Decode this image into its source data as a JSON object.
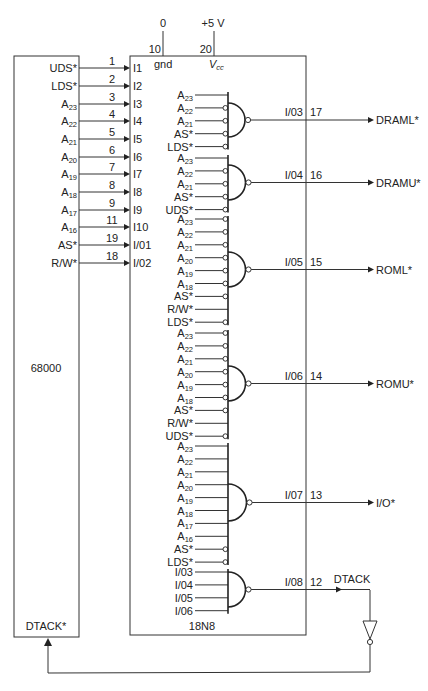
{
  "power": {
    "gnd_value": "0",
    "vcc_value": "+5 V",
    "gnd_pin": "10",
    "vcc_pin": "20",
    "gnd_label": "gnd",
    "vcc_label_main": "V",
    "vcc_label_sub": "cc"
  },
  "cpu": {
    "name": "68000",
    "dtack_label": "DTACK*",
    "signals": [
      {
        "base": "UDS*",
        "sub": "",
        "pin": "1",
        "pld_input": "I1"
      },
      {
        "base": "LDS*",
        "sub": "",
        "pin": "2",
        "pld_input": "I2"
      },
      {
        "base": "A",
        "sub": "23",
        "pin": "3",
        "pld_input": "I3"
      },
      {
        "base": "A",
        "sub": "22",
        "pin": "4",
        "pld_input": "I4"
      },
      {
        "base": "A",
        "sub": "21",
        "pin": "5",
        "pld_input": "I5"
      },
      {
        "base": "A",
        "sub": "20",
        "pin": "6",
        "pld_input": "I6"
      },
      {
        "base": "A",
        "sub": "19",
        "pin": "7",
        "pld_input": "I7"
      },
      {
        "base": "A",
        "sub": "18",
        "pin": "8",
        "pld_input": "I8"
      },
      {
        "base": "A",
        "sub": "17",
        "pin": "9",
        "pld_input": "I9"
      },
      {
        "base": "A",
        "sub": "16",
        "pin": "11",
        "pld_input": "I10"
      },
      {
        "base": "AS*",
        "sub": "",
        "pin": "19",
        "pld_input": "I/01"
      },
      {
        "base": "R/W*",
        "sub": "",
        "pin": "18",
        "pld_input": "I/02"
      }
    ]
  },
  "pld": {
    "name": "18N8",
    "gates": [
      {
        "output_pin_name": "I/03",
        "output_pin": "17",
        "signal": "DRAML*",
        "inputs": [
          {
            "base": "A",
            "sub": "23",
            "inverted": false
          },
          {
            "base": "A",
            "sub": "22",
            "inverted": true
          },
          {
            "base": "A",
            "sub": "21",
            "inverted": true
          },
          {
            "base": "AS*",
            "sub": "",
            "inverted": true
          },
          {
            "base": "LDS*",
            "sub": "",
            "inverted": true
          }
        ]
      },
      {
        "output_pin_name": "I/04",
        "output_pin": "16",
        "signal": "DRAMU*",
        "inputs": [
          {
            "base": "A",
            "sub": "23",
            "inverted": false
          },
          {
            "base": "A",
            "sub": "22",
            "inverted": true
          },
          {
            "base": "A",
            "sub": "21",
            "inverted": true
          },
          {
            "base": "AS*",
            "sub": "",
            "inverted": true
          },
          {
            "base": "UDS*",
            "sub": "",
            "inverted": true
          }
        ]
      },
      {
        "output_pin_name": "I/05",
        "output_pin": "15",
        "signal": "ROML*",
        "inputs": [
          {
            "base": "A",
            "sub": "23",
            "inverted": true
          },
          {
            "base": "A",
            "sub": "22",
            "inverted": true
          },
          {
            "base": "A",
            "sub": "21",
            "inverted": true
          },
          {
            "base": "A",
            "sub": "20",
            "inverted": true
          },
          {
            "base": "A",
            "sub": "19",
            "inverted": true
          },
          {
            "base": "A",
            "sub": "18",
            "inverted": true
          },
          {
            "base": "AS*",
            "sub": "",
            "inverted": true
          },
          {
            "base": "R/W*",
            "sub": "",
            "inverted": false
          },
          {
            "base": "LDS*",
            "sub": "",
            "inverted": true
          }
        ]
      },
      {
        "output_pin_name": "I/06",
        "output_pin": "14",
        "signal": "ROMU*",
        "inputs": [
          {
            "base": "A",
            "sub": "23",
            "inverted": true
          },
          {
            "base": "A",
            "sub": "22",
            "inverted": true
          },
          {
            "base": "A",
            "sub": "21",
            "inverted": true
          },
          {
            "base": "A",
            "sub": "20",
            "inverted": true
          },
          {
            "base": "A",
            "sub": "19",
            "inverted": true
          },
          {
            "base": "A",
            "sub": "18",
            "inverted": true
          },
          {
            "base": "AS*",
            "sub": "",
            "inverted": true
          },
          {
            "base": "R/W*",
            "sub": "",
            "inverted": false
          },
          {
            "base": "UDS*",
            "sub": "",
            "inverted": true
          }
        ]
      },
      {
        "output_pin_name": "I/07",
        "output_pin": "13",
        "signal": "I/O*",
        "inputs": [
          {
            "base": "A",
            "sub": "23",
            "inverted": false
          },
          {
            "base": "A",
            "sub": "22",
            "inverted": false
          },
          {
            "base": "A",
            "sub": "21",
            "inverted": false
          },
          {
            "base": "A",
            "sub": "20",
            "inverted": false
          },
          {
            "base": "A",
            "sub": "19",
            "inverted": false
          },
          {
            "base": "A",
            "sub": "18",
            "inverted": false
          },
          {
            "base": "A",
            "sub": "17",
            "inverted": false
          },
          {
            "base": "A",
            "sub": "16",
            "inverted": false
          },
          {
            "base": "AS*",
            "sub": "",
            "inverted": true
          },
          {
            "base": "LDS*",
            "sub": "",
            "inverted": true
          }
        ]
      },
      {
        "output_pin_name": "I/08",
        "output_pin": "12",
        "signal": "DTACK",
        "inputs": [
          {
            "base": "I/03",
            "sub": "",
            "inverted": false
          },
          {
            "base": "I/04",
            "sub": "",
            "inverted": false
          },
          {
            "base": "I/05",
            "sub": "",
            "inverted": false
          },
          {
            "base": "I/06",
            "sub": "",
            "inverted": false
          }
        ]
      }
    ]
  }
}
